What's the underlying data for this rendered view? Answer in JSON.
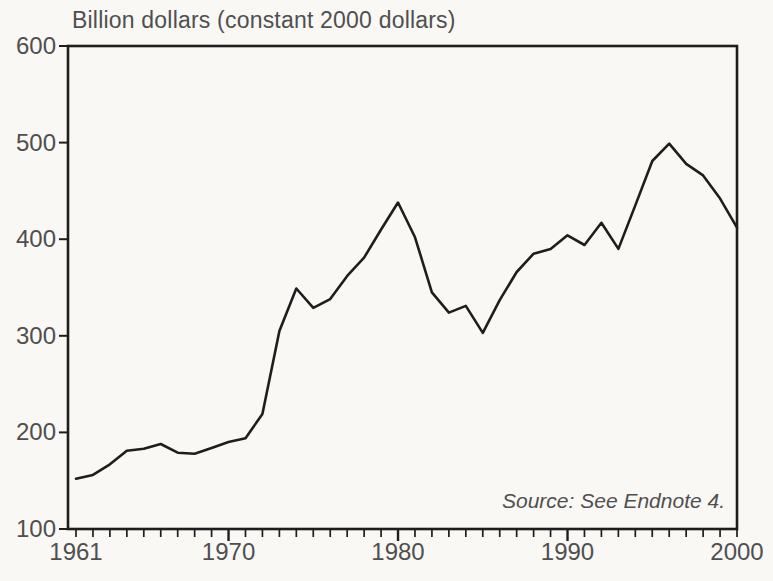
{
  "colors": {
    "background": "#f9f8f5",
    "label_text": "#4f4f4f",
    "line": "#1e1e1e",
    "axis": "#1e1e1e"
  },
  "chart_data": {
    "type": "line",
    "title": "Billion dollars (constant 2000 dollars)",
    "ylabel": "Billion dollars (constant 2000 dollars)",
    "xlabel": "",
    "annotation": "Source: See Endnote 4.",
    "legend": "none",
    "grid": false,
    "xlim": [
      1961,
      2000
    ],
    "ylim": [
      100,
      600
    ],
    "y_ticks": [
      100,
      200,
      300,
      400,
      500,
      600
    ],
    "x_tick_labels": [
      1961,
      1970,
      1980,
      1990,
      2000
    ],
    "x_major_ticks": [
      1970,
      1980,
      1990
    ],
    "x_minor_tick_interval": 1,
    "x": [
      1961,
      1962,
      1963,
      1964,
      1965,
      1966,
      1967,
      1968,
      1969,
      1970,
      1971,
      1972,
      1973,
      1974,
      1975,
      1976,
      1977,
      1978,
      1979,
      1980,
      1981,
      1982,
      1983,
      1984,
      1985,
      1986,
      1987,
      1988,
      1989,
      1990,
      1991,
      1992,
      1993,
      1994,
      1995,
      1996,
      1997,
      1998,
      1999,
      2000
    ],
    "values": [
      152,
      156,
      167,
      181,
      183,
      188,
      179,
      178,
      184,
      190,
      194,
      219,
      305,
      349,
      329,
      338,
      362,
      381,
      410,
      438,
      402,
      345,
      324,
      331,
      303,
      337,
      366,
      385,
      390,
      404,
      394,
      417,
      390,
      435,
      481,
      499,
      478,
      466,
      442,
      412
    ],
    "line_color": "#1e1e1e"
  }
}
